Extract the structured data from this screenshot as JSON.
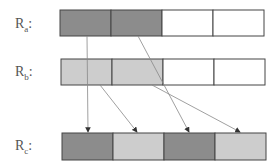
{
  "labels": {
    "ra": {
      "main": "R",
      "sub": "a",
      "suffix": ":"
    },
    "rb": {
      "main": "R",
      "sub": "b",
      "suffix": ":"
    },
    "rc": {
      "main": "R",
      "sub": "c",
      "suffix": ":"
    }
  },
  "colors": {
    "dark": "#8c8c8c",
    "light": "#cdcdcd",
    "empty": "#ffffff",
    "border": "#444444",
    "arrow": "#888888"
  },
  "rows": [
    {
      "name": "Ra",
      "cells": [
        "dark",
        "dark",
        "empty",
        "empty"
      ]
    },
    {
      "name": "Rb",
      "cells": [
        "light",
        "light",
        "empty",
        "empty"
      ]
    },
    {
      "name": "Rc",
      "cells": [
        "dark",
        "light",
        "dark",
        "light"
      ]
    }
  ]
}
